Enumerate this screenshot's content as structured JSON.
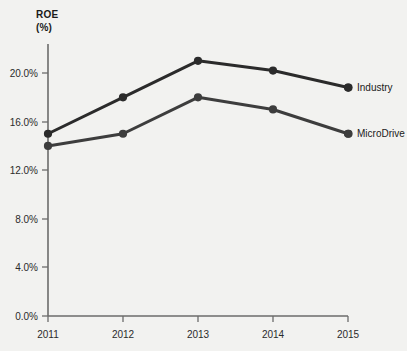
{
  "chart_data": {
    "type": "line",
    "title": "ROE",
    "subtitle": "(%)",
    "xlabel": "",
    "ylabel": "ROE (%)",
    "categories": [
      "2011",
      "2012",
      "2013",
      "2014",
      "2015"
    ],
    "x": [
      2011,
      2012,
      2013,
      2014,
      2015
    ],
    "series": [
      {
        "name": "Industry",
        "values": [
          15.0,
          18.0,
          21.0,
          20.2,
          18.8
        ],
        "color": "#2b2b2b"
      },
      {
        "name": "MicroDrive",
        "values": [
          14.0,
          15.0,
          18.0,
          17.0,
          15.0
        ],
        "color": "#3d3d3d"
      }
    ],
    "y_ticks": [
      "0.0%",
      "4.0%",
      "8.0%",
      "12.0%",
      "16.0%",
      "20.0%"
    ],
    "y_tick_values": [
      0,
      4,
      8,
      12,
      16,
      20
    ],
    "x_tick_labels": [
      "2011",
      "2012",
      "2013",
      "2014",
      "2015"
    ],
    "ylim": [
      0,
      24
    ],
    "xlim": [
      2011,
      2015
    ],
    "grid": false,
    "legend_position": "right-inline",
    "legend_entries": [
      "Industry",
      "MicroDrive"
    ],
    "background_color": "#f2f2f0",
    "axis_color": "#6b6b6b"
  },
  "labels": {
    "title": "ROE",
    "subtitle": "(%)",
    "series_industry": "Industry",
    "series_microdrive": "MicroDrive",
    "y0": "0.0%",
    "y1": "4.0%",
    "y2": "8.0%",
    "y3": "12.0%",
    "y4": "16.0%",
    "y5": "20.0%",
    "x0": "2011",
    "x1": "2012",
    "x2": "2013",
    "x3": "2014",
    "x4": "2015"
  }
}
